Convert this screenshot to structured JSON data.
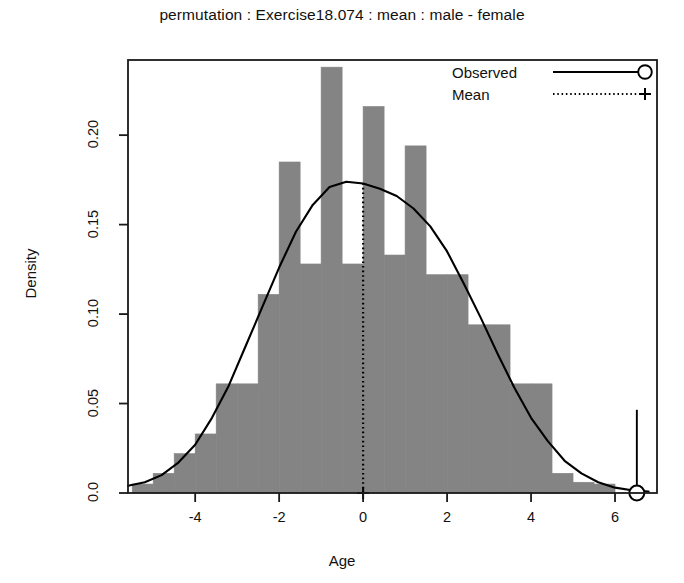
{
  "chart_data": {
    "type": "bar",
    "title": "permutation : Exercise18.074 : mean : male - female",
    "subtitle": "",
    "xlabel": "Age",
    "ylabel": "Density",
    "xlim": [
      -5.6,
      7.0
    ],
    "ylim": [
      0.0,
      0.242
    ],
    "grid": false,
    "xticks": [
      -4,
      -2,
      0,
      2,
      4,
      6
    ],
    "xtick_labels": [
      "-4",
      "-2",
      "0",
      "2",
      "4",
      "6"
    ],
    "yticks": [
      0.0,
      0.05,
      0.1,
      0.15,
      0.2
    ],
    "ytick_labels": [
      "0.0",
      "0.05",
      "0.10",
      "0.15",
      "0.20"
    ],
    "bin_width": 0.5,
    "bin_starts": [
      -5.5,
      -5.0,
      -4.5,
      -4.0,
      -3.5,
      -3.0,
      -2.5,
      -2.0,
      -1.5,
      -1.0,
      -0.5,
      0.0,
      0.5,
      1.0,
      1.5,
      2.0,
      2.5,
      3.0,
      3.5,
      4.0,
      4.5,
      5.0,
      5.5
    ],
    "bin_centers": [
      -5.25,
      -4.75,
      -4.25,
      -3.75,
      -3.25,
      -2.75,
      -2.25,
      -1.75,
      -1.25,
      -0.75,
      -0.25,
      0.25,
      0.75,
      1.25,
      1.75,
      2.25,
      2.75,
      3.25,
      3.75,
      4.25,
      4.75,
      5.25,
      5.75
    ],
    "categories": [
      "-5.25",
      "-4.75",
      "-4.25",
      "-3.75",
      "-3.25",
      "-2.75",
      "-2.25",
      "-1.75",
      "-1.25",
      "-0.75",
      "-0.25",
      "0.25",
      "0.75",
      "1.25",
      "1.75",
      "2.25",
      "2.75",
      "3.25",
      "3.75",
      "4.25",
      "4.75",
      "5.25",
      "5.75"
    ],
    "values": [
      0.005,
      0.011,
      0.022,
      0.033,
      0.061,
      0.061,
      0.111,
      0.185,
      0.128,
      0.238,
      0.128,
      0.216,
      0.133,
      0.194,
      0.122,
      0.122,
      0.094,
      0.094,
      0.061,
      0.061,
      0.011,
      0.006,
      0.005
    ],
    "series": [
      {
        "name": "Density (histogram)",
        "type": "bar",
        "values": [
          0.005,
          0.011,
          0.022,
          0.033,
          0.061,
          0.061,
          0.111,
          0.185,
          0.128,
          0.238,
          0.128,
          0.216,
          0.133,
          0.194,
          0.122,
          0.122,
          0.094,
          0.094,
          0.061,
          0.061,
          0.011,
          0.006,
          0.005
        ]
      },
      {
        "name": "Density curve",
        "type": "line",
        "x": [
          -5.6,
          -5.2,
          -4.8,
          -4.4,
          -4.0,
          -3.6,
          -3.2,
          -2.8,
          -2.4,
          -2.0,
          -1.6,
          -1.2,
          -0.8,
          -0.4,
          0.0,
          0.4,
          0.8,
          1.2,
          1.6,
          2.0,
          2.4,
          2.8,
          3.2,
          3.6,
          4.0,
          4.4,
          4.8,
          5.2,
          5.6,
          6.0,
          6.4,
          6.8
        ],
        "y": [
          0.004,
          0.006,
          0.01,
          0.017,
          0.027,
          0.042,
          0.06,
          0.082,
          0.104,
          0.126,
          0.146,
          0.161,
          0.171,
          0.174,
          0.173,
          0.17,
          0.166,
          0.159,
          0.149,
          0.135,
          0.117,
          0.098,
          0.078,
          0.059,
          0.042,
          0.029,
          0.018,
          0.011,
          0.006,
          0.003,
          0.0015,
          0.0008
        ]
      }
    ],
    "annotations": [
      {
        "name": "mean-line",
        "kind": "vertical-dotted",
        "x": 0.0,
        "y_from": 0.0,
        "y_to": 0.173,
        "marker": "plus",
        "marker_y": 0.0,
        "label": "Mean"
      },
      {
        "name": "observed-line",
        "kind": "vertical-solid",
        "x": 6.52,
        "y_from": 0.0,
        "y_to": 0.0465,
        "marker": "open-circle",
        "marker_y": 0.0,
        "label": "Observed"
      }
    ],
    "legend": {
      "position": "top-right",
      "entries": [
        {
          "label": "Observed",
          "line_style": "solid",
          "marker": "open-circle"
        },
        {
          "label": "Mean",
          "line_style": "dotted",
          "marker": "plus"
        }
      ]
    }
  },
  "colors": {
    "bar_fill": "#848484",
    "bar_edge": "#848484",
    "curve": "#000000",
    "axis": "#1a1a1a",
    "text": "#111111",
    "background": "#ffffff"
  }
}
